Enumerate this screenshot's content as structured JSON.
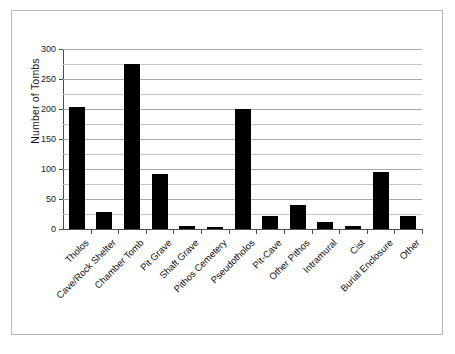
{
  "figure": {
    "border_color": "#b8b8b8",
    "background": "#ffffff",
    "caption": ""
  },
  "chart_data": {
    "type": "bar",
    "title": "",
    "xlabel": "",
    "ylabel": "Number of Tombs",
    "ylim": [
      0,
      300
    ],
    "y_ticks": [
      0,
      50,
      100,
      150,
      200,
      250,
      300
    ],
    "y_tick_labels": [
      "0",
      "50",
      "100",
      "150",
      "200",
      "250",
      "300"
    ],
    "y_minor_gridlines": [
      25,
      75,
      125,
      175,
      225,
      275
    ],
    "grid": true,
    "legend": null,
    "bar_color": "#000000",
    "categories": [
      "Tholos",
      "Cave/Rock Shelter",
      "Chamber Tomb",
      "Pit Grave",
      "Shaft Grave",
      "Pithos Cemetery",
      "Pseudotholos",
      "Pit-Cave",
      "Other Pithos",
      "Intramural",
      "Cist",
      "Burial Enclosure",
      "Other"
    ],
    "values": [
      204,
      28,
      275,
      91,
      5,
      3,
      200,
      21,
      40,
      12,
      5,
      95,
      21
    ]
  }
}
